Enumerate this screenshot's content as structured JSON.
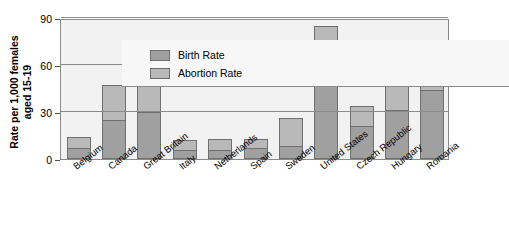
{
  "chart_data": {
    "type": "bar",
    "title": "",
    "subtitle": "",
    "xlabel": "",
    "ylabel": "Rate per 1,000 females aged 15-19",
    "ylabel_line1": "Rate per 1,000 females",
    "ylabel_line2": "aged 15-19",
    "ylim": [
      0,
      90
    ],
    "yticks": [
      0,
      30,
      60,
      90
    ],
    "grid": true,
    "stacked": true,
    "legend_position": "top-left",
    "categories": [
      "Belgium",
      "Canada",
      "Great Britain",
      "Italy",
      "Netherlands",
      "Spain",
      "Sweden",
      "United States",
      "Czech Republic",
      "Hungary",
      "Romania"
    ],
    "series": [
      {
        "name": "Birth Rate",
        "color": "#a0a0a0",
        "values": [
          7,
          25,
          30,
          6,
          6,
          7,
          8,
          57,
          21,
          31,
          44
        ]
      },
      {
        "name": "Abortion Rate",
        "color": "#b9b9b9",
        "values": [
          7,
          22,
          19,
          6,
          7,
          6,
          18,
          28,
          13,
          30,
          32
        ]
      }
    ],
    "totals": [
      14,
      47,
      49,
      12,
      13,
      13,
      26,
      85,
      34,
      61,
      76
    ]
  },
  "legend": {
    "items": [
      {
        "label": "Birth Rate",
        "swatch": "birth-rate-swatch"
      },
      {
        "label": "Abortion Rate",
        "swatch": "abortion-rate-swatch"
      }
    ]
  },
  "colors": {
    "birth_rate": "#a0a0a0",
    "abortion_rate": "#b9b9b9",
    "plot_background": "#f2f2f2",
    "axis": "#8a8a8a",
    "text": "#000000"
  }
}
